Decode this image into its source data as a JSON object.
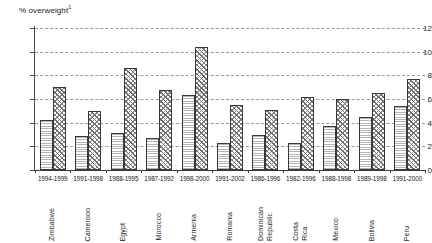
{
  "chart_data": {
    "type": "bar",
    "title": "% overweight",
    "title_superscript": "1",
    "ylabel": "% overweight",
    "xlabel": "",
    "ylim": [
      0,
      12
    ],
    "yticks": [
      0,
      2,
      4,
      6,
      8,
      10,
      12
    ],
    "grid": true,
    "legend_position": "none",
    "categories": [
      "Zimbabwe",
      "Cameroon",
      "Egypt",
      "Morocco",
      "Armenia",
      "Romania",
      "Dominican\nRepublic",
      "Costa\nRica",
      "Mexico",
      "Bolivia",
      "Peru"
    ],
    "periods": [
      "1994-1999",
      "1991-1998",
      "1988-1995",
      "1987-1992",
      "1998-2000",
      "1991-2002",
      "1986-1996",
      "1982-1996",
      "1988-1998",
      "1989-1998",
      "1991-2000"
    ],
    "series": [
      {
        "name": "earlier-survey",
        "values": [
          4.2,
          2.9,
          3.1,
          2.7,
          6.3,
          2.3,
          3.0,
          2.3,
          3.7,
          4.5,
          5.4
        ]
      },
      {
        "name": "later-survey",
        "values": [
          7.0,
          5.0,
          8.6,
          6.8,
          10.4,
          5.5,
          5.1,
          6.2,
          6.0,
          6.5,
          7.7
        ]
      }
    ]
  },
  "colors": {
    "axis": "#3a3a3a",
    "grid": "#9a9a9a",
    "series1": "#b4b4b4",
    "series2": "#6e6e6e",
    "text": "#1a1a1a",
    "background": "#ffffff"
  }
}
